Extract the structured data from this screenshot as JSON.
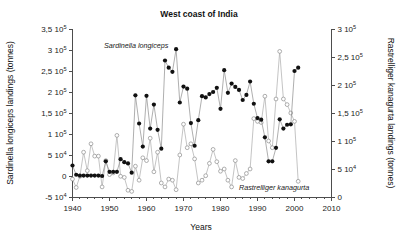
{
  "figure": {
    "title": "West coast of India",
    "xlabel": "Years",
    "ylabel_left": "Sardinella longiceps landings (tonnes)",
    "ylabel_right": "Rastrelliger kanagurta landings (tonnes)",
    "series_label_a": "Sardinella longiceps",
    "series_label_b": "Rastrelliger kanagurta",
    "colors": {
      "series_a": "#111111",
      "series_b": "#8c8c8c",
      "axis": "#4d4d4d",
      "background": "#ffffff"
    }
  },
  "axes": {
    "x_ticklabels": [
      "1940",
      "1950",
      "1960",
      "1970",
      "1980",
      "1990",
      "2000",
      "2010"
    ],
    "y_left_ticklabels": [
      "3,5 10",
      "3 10",
      "2,5 10",
      "2 10",
      "1,5 10",
      "1 10",
      "5 10",
      "0",
      "-5 10"
    ],
    "y_left_exponents": [
      "5",
      "5",
      "5",
      "5",
      "5",
      "5",
      "4",
      "",
      "4"
    ],
    "y_right_ticklabels": [
      "3 10",
      "2,5 10",
      "2 10",
      "1,5 10",
      "1 10",
      "5 10",
      "0"
    ],
    "y_right_exponents": [
      "5",
      "5",
      "5",
      "5",
      "5",
      "4",
      ""
    ],
    "x_minor_tick_interval_years": 2
  },
  "chart_data": {
    "type": "line",
    "title": "West coast of India",
    "xlabel": "Years",
    "ylabel": "Sardinella longiceps landings (tonnes)",
    "ylabel_secondary": "Rastrelliger kanagurta landings (tonnes)",
    "xlim": [
      1940,
      2010
    ],
    "ylim": [
      -50000,
      350000
    ],
    "ylim_secondary": [
      0,
      300000
    ],
    "grid": false,
    "legend": "inline-annotations",
    "series": [
      {
        "name": "Sardinella longiceps",
        "axis": "left",
        "marker": "filled-circle",
        "color": "#111111",
        "x": [
          1940,
          1941,
          1942,
          1943,
          1944,
          1945,
          1946,
          1947,
          1948,
          1949,
          1950,
          1951,
          1952,
          1953,
          1954,
          1955,
          1956,
          1957,
          1958,
          1959,
          1960,
          1961,
          1962,
          1963,
          1964,
          1965,
          1966,
          1967,
          1968,
          1969,
          1970,
          1971,
          1972,
          1973,
          1974,
          1975,
          1976,
          1977,
          1978,
          1979,
          1980,
          1981,
          1982,
          1983,
          1984,
          1985,
          1986,
          1987,
          1988,
          1989,
          1990,
          1991,
          1992,
          1993,
          1994,
          1995,
          1996,
          1997,
          1998,
          1999,
          2000,
          2001
        ],
        "values": [
          25000,
          3000,
          1000,
          1000,
          1000,
          1000,
          1000,
          1000,
          0,
          35000,
          10000,
          10000,
          10000,
          40000,
          33000,
          30000,
          8000,
          192000,
          125000,
          70000,
          191000,
          113000,
          170000,
          110000,
          65000,
          275000,
          258000,
          248000,
          302000,
          175000,
          213000,
          208000,
          126000,
          72000,
          133000,
          190000,
          187000,
          195000,
          200000,
          210000,
          160000,
          252000,
          198000,
          220000,
          212000,
          205000,
          181000,
          193000,
          225000,
          172000,
          138000,
          134000,
          92000,
          35000,
          35000,
          67000,
          135000,
          113000,
          122000,
          123000,
          250000,
          258000
        ],
        "notes": "Peak ~3,0 10^5 t in 1968; values near zero 1941-1948"
      },
      {
        "name": "Rastrelliger kanagurta",
        "axis": "right",
        "marker": "open-circle",
        "color": "#8c8c8c",
        "x": [
          1940,
          1941,
          1942,
          1943,
          1944,
          1945,
          1946,
          1947,
          1948,
          1949,
          1950,
          1951,
          1952,
          1953,
          1954,
          1955,
          1956,
          1957,
          1958,
          1959,
          1960,
          1961,
          1962,
          1963,
          1964,
          1965,
          1966,
          1967,
          1968,
          1969,
          1970,
          1971,
          1972,
          1973,
          1974,
          1975,
          1976,
          1977,
          1978,
          1979,
          1980,
          1981,
          1982,
          1983,
          1984,
          1985,
          1986,
          1987,
          1988,
          1989,
          1990,
          1991,
          1992,
          1993,
          1994,
          1995,
          1996,
          1997,
          1998,
          1999,
          2000,
          2001
        ],
        "values": [
          32000,
          17000,
          37000,
          80000,
          47000,
          95000,
          73000,
          73000,
          18000,
          65000,
          40000,
          43000,
          110000,
          37000,
          35000,
          12000,
          10000,
          55000,
          30000,
          70000,
          65000,
          105000,
          45000,
          80000,
          25000,
          18000,
          32000,
          30000,
          13000,
          75000,
          130000,
          88000,
          95000,
          68000,
          25000,
          30000,
          38000,
          60000,
          85000,
          63000,
          46000,
          50000,
          30000,
          18000,
          65000,
          35000,
          33000,
          42000,
          50000,
          140000,
          135000,
          133000,
          180000,
          100000,
          88000,
          175000,
          260000,
          175000,
          165000,
          150000,
          135000,
          28000
        ],
        "notes": "Peak ~2,6 10^5 t in 1996"
      }
    ]
  }
}
